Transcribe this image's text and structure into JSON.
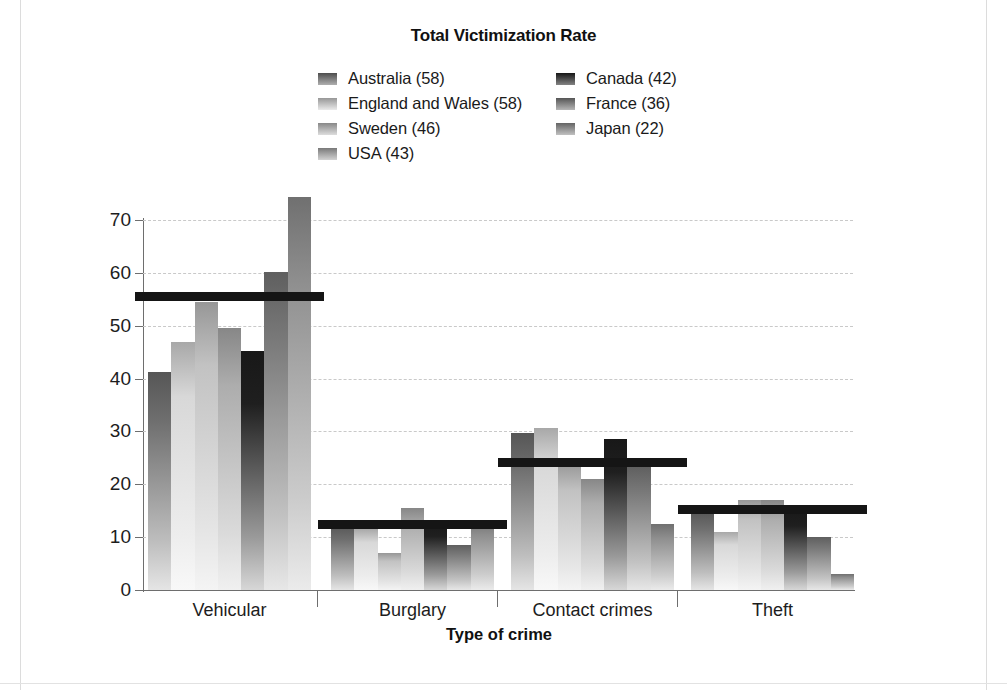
{
  "chart_data": {
    "type": "bar",
    "title": "Total Victimization Rate",
    "xlabel": "Type of crime",
    "ylabel": "Percent of offenses",
    "ylim": [
      0,
      70
    ],
    "ytick_values": [
      0,
      10,
      20,
      30,
      40,
      50,
      60,
      70
    ],
    "ytick_labels": [
      "0",
      "10",
      "20",
      "30",
      "40",
      "50",
      "60",
      "70"
    ],
    "grid": true,
    "legend_position": "top-center",
    "categories": [
      "Vehicular",
      "Burglary",
      "Contact crimes",
      "Theft"
    ],
    "series": [
      {
        "name": "Australia (58)",
        "short": "Australia",
        "color": "#6e6e6e",
        "values": [
          41.2,
          12.3,
          29.8,
          15.0
        ]
      },
      {
        "name": "England and Wales (58)",
        "short": "England and Wales",
        "color": "#d8d8d8",
        "values": [
          47.0,
          11.5,
          30.7,
          11.0
        ]
      },
      {
        "name": "Sweden (46)",
        "short": "Sweden",
        "color": "#c2c2c2",
        "values": [
          54.5,
          7.0,
          24.0,
          17.0
        ]
      },
      {
        "name": "USA (43)",
        "short": "USA",
        "color": "#adadad",
        "values": [
          49.5,
          15.5,
          21.0,
          17.0
        ]
      },
      {
        "name": "Canada (42)",
        "short": "Canada",
        "color": "#1f1f1f",
        "values": [
          45.3,
          13.0,
          28.5,
          15.5
        ]
      },
      {
        "name": "France (36)",
        "short": "France",
        "color": "#7a7a7a",
        "values": [
          60.2,
          8.5,
          23.5,
          10.0
        ]
      },
      {
        "name": "Japan (22)",
        "short": "Japan",
        "color": "#8f8f8f",
        "values": [
          74.3,
          13.3,
          12.5,
          3.0
        ]
      }
    ],
    "reference_lines": [
      {
        "category": "Vehicular",
        "value": 55.4
      },
      {
        "category": "Burglary",
        "value": 12.3
      },
      {
        "category": "Contact crimes",
        "value": 24.0
      },
      {
        "category": "Theft",
        "value": 15.2
      }
    ]
  }
}
